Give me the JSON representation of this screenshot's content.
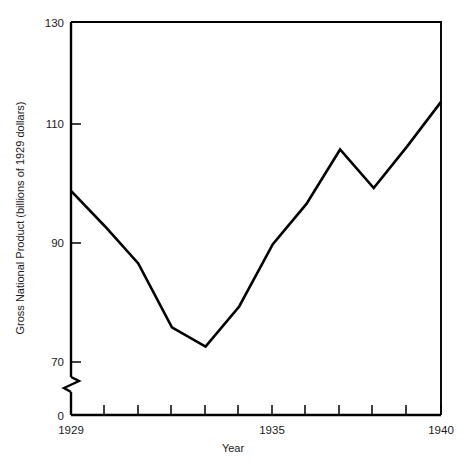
{
  "chart_data": {
    "type": "line",
    "title": "",
    "xlabel": "Year",
    "ylabel": "Gross National Product (billions of 1929 dollars)",
    "x": [
      1929,
      1930,
      1931,
      1932,
      1933,
      1934,
      1935,
      1936,
      1937,
      1938,
      1939,
      1940
    ],
    "values": [
      100.2,
      94.0,
      87.4,
      76.1,
      72.7,
      79.8,
      90.8,
      97.9,
      107.5,
      100.7,
      108.1,
      115.9
    ],
    "series": [
      {
        "name": "Gross National Product",
        "values": [
          100.2,
          94.0,
          87.4,
          76.1,
          72.7,
          79.8,
          90.8,
          97.9,
          107.5,
          100.7,
          108.1,
          115.9
        ]
      }
    ],
    "xlim": [
      1929,
      1940
    ],
    "ylim": [
      70,
      130
    ],
    "y_axis_break": true,
    "y_break_from": 0,
    "y_break_to": 70,
    "x_tick_labels": [
      "1929",
      "1935",
      "1940"
    ],
    "x_tick_label_values": [
      1929,
      1935,
      1940
    ],
    "x_ticks_all": [
      1929,
      1930,
      1931,
      1932,
      1933,
      1934,
      1935,
      1936,
      1937,
      1938,
      1939,
      1940
    ],
    "y_tick_labels": [
      "0",
      "70",
      "90",
      "110",
      "130"
    ],
    "y_tick_values": [
      0,
      70,
      90,
      110,
      130
    ],
    "grid": false,
    "legend": false,
    "legend_position": "none",
    "line_color": "#000000",
    "background_color": "#ffffff"
  }
}
